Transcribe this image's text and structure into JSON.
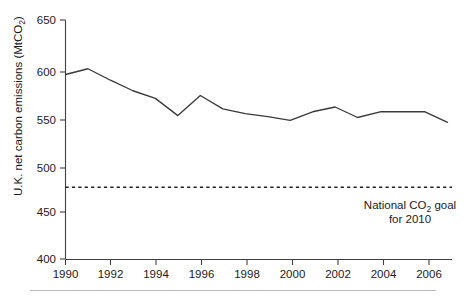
{
  "chart_data": {
    "type": "line",
    "title": "",
    "xlabel": "",
    "ylabel_parts": {
      "main": "U.K. net carbon emissions (MtCO",
      "sub": "2",
      "tail": ")"
    },
    "ylabel": "U.K. net carbon emissions (MtCO2)",
    "x": [
      1990,
      1991,
      1992,
      1993,
      1994,
      1995,
      1996,
      1997,
      1998,
      1999,
      2000,
      2001,
      2002,
      2003,
      2004,
      2005,
      2006,
      2007
    ],
    "series": [
      {
        "name": "U.K. net carbon emissions",
        "values": [
          593,
          599,
          587,
          576,
          568,
          550,
          571,
          557,
          552,
          549,
          545,
          554,
          559,
          548,
          554,
          554,
          554,
          543
        ]
      }
    ],
    "xlim": [
      1990,
      2007.2
    ],
    "ylim": [
      400,
      650
    ],
    "xticks": [
      1990,
      1992,
      1994,
      1996,
      1998,
      2000,
      2002,
      2004,
      2006
    ],
    "xtick_labels": [
      "1990",
      "1992",
      "1994",
      "1996",
      "1998",
      "2000",
      "2002",
      "2004",
      "2006"
    ],
    "yticks": [
      400,
      450,
      500,
      550,
      600,
      650
    ],
    "ytick_labels": [
      "400",
      "450",
      "500",
      "550",
      "600",
      "650"
    ],
    "grid": false,
    "legend": "none",
    "annotations": [
      {
        "name": "national-goal-threshold",
        "type": "hline",
        "value": 475,
        "style": "dotted",
        "label_line1_pre": "National CO",
        "label_line1_sub": "2",
        "label_line1_post": " goal",
        "label_line2": "for 2010",
        "label": "National CO2 goal for 2010"
      }
    ]
  }
}
